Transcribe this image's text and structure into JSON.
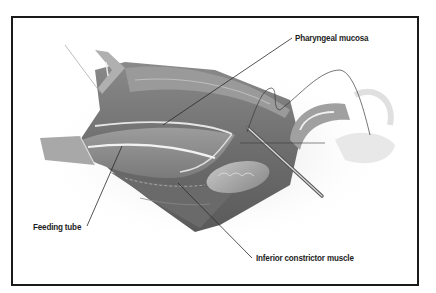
{
  "figure": {
    "labels": {
      "pharyngeal_mucosa": "Pharyngeal mucosa",
      "feeding_tube": "Feeding tube",
      "inferior_constrictor": "Inferior constrictor muscle"
    }
  }
}
